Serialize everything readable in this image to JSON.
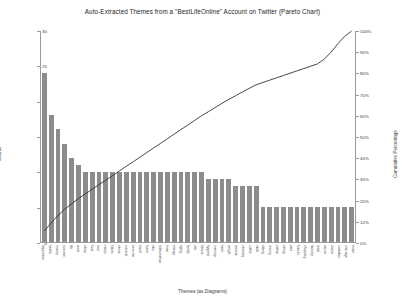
{
  "chart_data": {
    "type": "bar",
    "title": "Auto-Extracted Themes from a \"BestLifeOnline\" Account on Twitter (Pareto Chart)",
    "xlabel": "Themes (as Diagrams)",
    "ylabel": "Counts",
    "y2label": "Cumulative Percentage",
    "ylim": [
      0,
      30
    ],
    "y2lim": [
      0,
      100
    ],
    "grid": false,
    "legend": null,
    "bar_color": "#8c8c8c",
    "line_color": "#333333",
    "yticks": [
      0,
      5,
      10,
      15,
      20,
      25,
      30
    ],
    "y2ticks": [
      "0%",
      "10%",
      "20%",
      "30%",
      "40%",
      "50%",
      "60%",
      "70%",
      "80%",
      "90%",
      "100%"
    ],
    "categories": [
      "happiness",
      "health",
      "money",
      "success",
      "life",
      "work",
      "sleep",
      "food",
      "love",
      "career",
      "habits",
      "stress",
      "mindset",
      "exercise",
      "travel",
      "home",
      "skin",
      "relationships",
      "brain",
      "energy",
      "aging",
      "family",
      "diet",
      "fitness",
      "hygiene",
      "memory",
      "heart",
      "weight",
      "anxiety",
      "cleaning",
      "coffee",
      "skills",
      "dating",
      "driving",
      "safety",
      "sitting",
      "pets",
      "friends",
      "shopping",
      "laundry",
      "retail",
      "airport",
      "doctor",
      "mistakes",
      "marriage",
      "email"
    ],
    "values": [
      24,
      18,
      16,
      14,
      12,
      11,
      10,
      10,
      10,
      10,
      10,
      10,
      10,
      10,
      10,
      10,
      10,
      10,
      10,
      10,
      10,
      10,
      10,
      10,
      9,
      9,
      9,
      9,
      8,
      8,
      8,
      8,
      5,
      5,
      5,
      5,
      5,
      5,
      5,
      5,
      5,
      5,
      5,
      5,
      5,
      5
    ],
    "cumulative_percent": [
      5.2,
      9.1,
      12.6,
      15.6,
      18.2,
      20.6,
      22.8,
      25.0,
      27.2,
      29.3,
      31.5,
      33.7,
      35.9,
      38.0,
      40.2,
      42.4,
      44.6,
      46.7,
      48.9,
      51.1,
      53.3,
      55.4,
      57.6,
      59.8,
      61.7,
      63.7,
      65.7,
      67.6,
      69.3,
      71.1,
      72.8,
      74.5,
      75.6,
      76.7,
      77.8,
      78.9,
      80.0,
      81.1,
      82.2,
      83.3,
      84.4,
      86.7,
      90.0,
      94.0,
      97.5,
      100.0
    ]
  }
}
